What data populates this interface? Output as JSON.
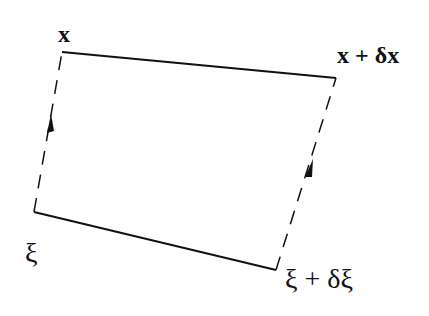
{
  "diagram": {
    "type": "parallelogram-mapping",
    "colors": {
      "stroke": "#111111",
      "background": "#ffffff"
    },
    "labels": {
      "top_left": "x",
      "top_right": "x + δx",
      "bottom_left": "ξ",
      "bottom_right": "ξ + δξ"
    },
    "edges": [
      {
        "name": "top-edge",
        "style": "solid",
        "from": "x",
        "to": "x + δx"
      },
      {
        "name": "bottom-edge",
        "style": "solid",
        "from": "ξ",
        "to": "ξ + δξ"
      },
      {
        "name": "left-edge",
        "style": "dashed",
        "from": "ξ",
        "to": "x",
        "arrow": "up"
      },
      {
        "name": "right-edge",
        "style": "dashed",
        "from": "ξ + δξ",
        "to": "x + δx",
        "arrow": "up"
      }
    ]
  }
}
